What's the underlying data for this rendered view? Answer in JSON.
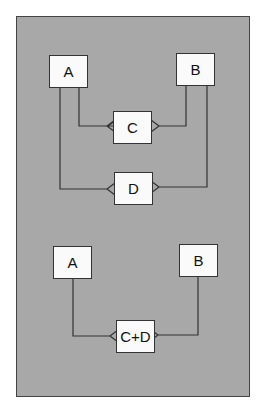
{
  "diagram": {
    "top": {
      "entities": [
        {
          "id": "A",
          "label": "A"
        },
        {
          "id": "B",
          "label": "B"
        },
        {
          "id": "C",
          "label": "C"
        },
        {
          "id": "D",
          "label": "D"
        }
      ],
      "relationships": [
        {
          "from": "A",
          "to": "C",
          "notation": "crow-foot many at C"
        },
        {
          "from": "B",
          "to": "C",
          "notation": "crow-foot many at C"
        },
        {
          "from": "A",
          "to": "D",
          "notation": "crow-foot many at D"
        },
        {
          "from": "B",
          "to": "D",
          "notation": "crow-foot many at D"
        }
      ]
    },
    "bottom": {
      "entities": [
        {
          "id": "A",
          "label": "A"
        },
        {
          "id": "B",
          "label": "B"
        },
        {
          "id": "CD",
          "label": "C+D"
        }
      ],
      "relationships": [
        {
          "from": "A",
          "to": "CD",
          "notation": "crow-foot many at C+D"
        },
        {
          "from": "B",
          "to": "CD",
          "notation": "crow-foot many at C+D"
        }
      ]
    }
  },
  "colors": {
    "panel": "#a8a8a8",
    "box": "#fafafa",
    "line": "#333333"
  }
}
